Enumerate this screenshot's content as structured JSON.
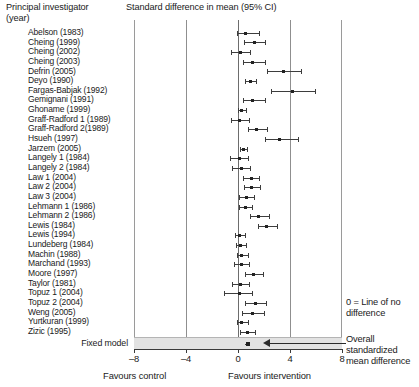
{
  "header": {
    "study_column_title": "Principal investigator\n(year)",
    "plot_column_title": "Standard difference in mean (95% CI)"
  },
  "footer": {
    "fixed_model_label": "Fixed model",
    "favours_control": "Favours control",
    "favours_intervention": "Favours intervention"
  },
  "annotations": {
    "zero_line": "0 = Line of no difference",
    "overall": "Overall  standardized\nmean difference"
  },
  "axis": {
    "ticks": [
      "–8",
      "–4",
      "0",
      "4",
      "8"
    ],
    "tick_values": [
      -8,
      -4,
      0,
      4,
      8
    ],
    "min": -8,
    "max": 8
  },
  "colors": {
    "marker": "#222222",
    "ci_line": "#3d3d3d",
    "gridline": "#8f8f8f",
    "zero_line": "#6d6d6d",
    "summary_band": "#e2e2e2",
    "axis": "#3a3a3a",
    "text": "#1a1a1a"
  },
  "chart_data": {
    "type": "forest",
    "title": "Standard difference in mean (95% CI)",
    "xlabel": "Standard difference in mean",
    "ylabel": "Principal investigator (year)",
    "xlim": [
      -8,
      8
    ],
    "xticks": [
      -8,
      -4,
      0,
      4,
      8
    ],
    "grid": false,
    "reference_line": 0,
    "reference_line_label": "0 = Line of no difference",
    "left_favours": "Favours control",
    "right_favours": "Favours intervention",
    "model": "Fixed model",
    "summary_label": "Overall standardized mean difference",
    "studies": [
      {
        "label": "Abelson (1983)",
        "estimate": 0.55,
        "ci_low": -0.05,
        "ci_high": 1.6
      },
      {
        "label": "Cheing (1999)",
        "estimate": 1.25,
        "ci_low": 0.45,
        "ci_high": 2.1
      },
      {
        "label": "Cheing (2002)",
        "estimate": 0.2,
        "ci_low": -0.55,
        "ci_high": 0.95
      },
      {
        "label": "Cheing (2003)",
        "estimate": 1.15,
        "ci_low": 0.35,
        "ci_high": 2.1
      },
      {
        "label": "Defrin (2005)",
        "estimate": 3.5,
        "ci_low": 2.2,
        "ci_high": 4.85
      },
      {
        "label": "Deyo (1990)",
        "estimate": 0.95,
        "ci_low": 0.55,
        "ci_high": 1.4
      },
      {
        "label": "Fargas-Babjak (1992)",
        "estimate": 4.2,
        "ci_low": 2.55,
        "ci_high": 5.95
      },
      {
        "label": "Gemignani (1991)",
        "estimate": 1.15,
        "ci_low": 0.35,
        "ci_high": 2.05
      },
      {
        "label": "Ghoname (1999)",
        "estimate": 0.25,
        "ci_low": 0.0,
        "ci_high": 0.6
      },
      {
        "label": "Graff-Radford 1 (1989)",
        "estimate": 0.1,
        "ci_low": -0.55,
        "ci_high": 0.85
      },
      {
        "label": "Graff-Radford 2(1989)",
        "estimate": 1.4,
        "ci_low": 0.75,
        "ci_high": 2.2
      },
      {
        "label": "Hsueh (1997)",
        "estimate": 3.2,
        "ci_low": 2.1,
        "ci_high": 4.6
      },
      {
        "label": "Jarzem (2005)",
        "estimate": 0.4,
        "ci_low": 0.15,
        "ci_high": 0.7
      },
      {
        "label": "Langely 1 (1984)",
        "estimate": 0.1,
        "ci_low": -0.6,
        "ci_high": 0.8
      },
      {
        "label": "Langely 2 (1984)",
        "estimate": 0.25,
        "ci_low": -0.45,
        "ci_high": 0.95
      },
      {
        "label": "Law 1 (2004)",
        "estimate": 1.0,
        "ci_low": 0.4,
        "ci_high": 1.65
      },
      {
        "label": "Law 2 (2004)",
        "estimate": 1.05,
        "ci_low": 0.45,
        "ci_high": 1.7
      },
      {
        "label": "Law 3 (2004)",
        "estimate": 0.65,
        "ci_low": 0.1,
        "ci_high": 1.2
      },
      {
        "label": "Lehmann 1 (1986)",
        "estimate": 0.55,
        "ci_low": 0.05,
        "ci_high": 1.1
      },
      {
        "label": "Lehmann 2 (1986)",
        "estimate": 1.6,
        "ci_low": 0.95,
        "ci_high": 2.35
      },
      {
        "label": "Lewis (1984)",
        "estimate": 2.2,
        "ci_low": 1.5,
        "ci_high": 3.0
      },
      {
        "label": "Lewis (1994)",
        "estimate": 0.15,
        "ci_low": -0.2,
        "ci_high": 0.55
      },
      {
        "label": "Lundeberg (1984)",
        "estimate": 0.2,
        "ci_low": -0.15,
        "ci_high": 0.6
      },
      {
        "label": "Machin (1988)",
        "estimate": 0.3,
        "ci_low": -0.1,
        "ci_high": 0.8
      },
      {
        "label": "Marchand (1993)",
        "estimate": 0.25,
        "ci_low": -0.3,
        "ci_high": 0.85
      },
      {
        "label": "Moore (1997)",
        "estimate": 1.2,
        "ci_low": 0.5,
        "ci_high": 1.9
      },
      {
        "label": "Taylor (1981)",
        "estimate": 0.2,
        "ci_low": -0.45,
        "ci_high": 0.85
      },
      {
        "label": "Topuz 1 (2004)",
        "estimate": 0.15,
        "ci_low": -1.05,
        "ci_high": 1.1
      },
      {
        "label": "Topuz 2 (2004)",
        "estimate": 1.35,
        "ci_low": 0.55,
        "ci_high": 2.15
      },
      {
        "label": "Weng (2005)",
        "estimate": 1.1,
        "ci_low": 0.3,
        "ci_high": 2.0
      },
      {
        "label": "Yurtkuran (1999)",
        "estimate": 0.3,
        "ci_low": -0.05,
        "ci_high": 0.8
      },
      {
        "label": "Zizic (1995)",
        "estimate": 0.7,
        "ci_low": 0.15,
        "ci_high": 1.3
      }
    ],
    "summary": {
      "label": "Fixed model",
      "estimate": 0.75,
      "ci_low": 0.55,
      "ci_high": 0.95
    }
  }
}
